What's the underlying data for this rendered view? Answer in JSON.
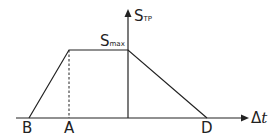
{
  "diagram": {
    "y_axis": {
      "main": "S",
      "sub": "TP"
    },
    "x_axis": {
      "delta": "Δ",
      "var": "t"
    },
    "peak_label": {
      "main": "S",
      "sub": "max"
    },
    "points": {
      "B": "B",
      "A": "A",
      "D": "D"
    },
    "colors": {
      "line": "#222222",
      "background": "#ffffff"
    }
  }
}
